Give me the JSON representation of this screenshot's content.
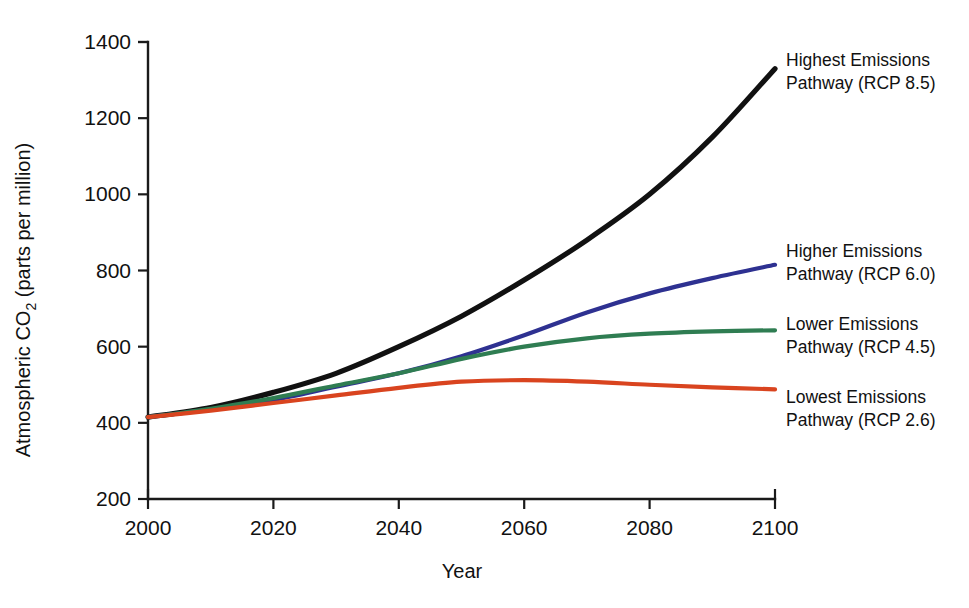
{
  "chart_data": {
    "type": "line",
    "title": "",
    "subtitle": "",
    "xlabel": "Year",
    "ylabel": "Atmospheric CO2 (parts per million)",
    "ylabel_prefix": "Atmospheric CO",
    "ylabel_sub": "2",
    "ylabel_suffix": " (parts per million)",
    "xlim": [
      2000,
      2100
    ],
    "ylim": [
      200,
      1400
    ],
    "xticks": [
      2000,
      2020,
      2040,
      2060,
      2080,
      2100
    ],
    "xtick_labels": [
      "2000",
      "2020",
      "2040",
      "2060",
      "2080",
      "2100"
    ],
    "yticks": [
      200,
      400,
      600,
      800,
      1000,
      1200,
      1400
    ],
    "ytick_labels": [
      "200",
      "400",
      "600",
      "800",
      "1000",
      "1200",
      "1400"
    ],
    "grid": false,
    "legend_position": "right-inline-annotations",
    "x": [
      2000,
      2010,
      2020,
      2030,
      2040,
      2050,
      2060,
      2070,
      2080,
      2090,
      2100
    ],
    "series": [
      {
        "name": "Highest Emissions Pathway (RCP 8.5)",
        "label_line1": "Highest Emissions",
        "label_line2": "Pathway (RCP 8.5)",
        "color": "#111111",
        "values": [
          415,
          440,
          480,
          530,
          600,
          680,
          775,
          880,
          1000,
          1150,
          1330
        ]
      },
      {
        "name": "Higher Emissions Pathway (RCP 6.0)",
        "label_line1": "Higher Emissions",
        "label_line2": "Pathway (RCP 6.0)",
        "color": "#2e3191",
        "values": [
          415,
          435,
          460,
          495,
          530,
          575,
          630,
          690,
          740,
          780,
          815
        ]
      },
      {
        "name": "Lower Emissions Pathway (RCP 4.5)",
        "label_line1": "Lower Emissions",
        "label_line2": "Pathway (RCP 4.5)",
        "color": "#2f7d52",
        "values": [
          415,
          437,
          465,
          498,
          530,
          568,
          600,
          622,
          634,
          640,
          643
        ]
      },
      {
        "name": "Lowest Emissions Pathway (RCP 2.6)",
        "label_line1": "Lowest Emissions",
        "label_line2": "Pathway (RCP 2.6)",
        "color": "#d9441f",
        "values": [
          415,
          432,
          452,
          472,
          492,
          508,
          512,
          508,
          500,
          493,
          488
        ]
      }
    ]
  }
}
